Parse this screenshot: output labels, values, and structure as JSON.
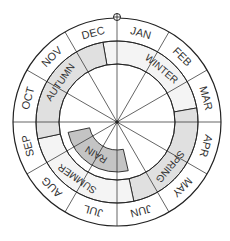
{
  "diagram": {
    "center": [
      117,
      122
    ],
    "radii": {
      "outer": 104,
      "month_inner": 81,
      "season_inner": 58,
      "rain_outer": 50,
      "rain_inner": 28
    },
    "months": [
      "JAN",
      "FEB",
      "MAR",
      "APR",
      "MAY",
      "JUN",
      "JUL",
      "AUG",
      "SEP",
      "OCT",
      "NOV",
      "DEC"
    ],
    "seasons": [
      {
        "label": "WINTER",
        "start": 350,
        "end": 80,
        "fill": "#f4f4f4",
        "label_angle": 40
      },
      {
        "label": "SPRING",
        "start": 80,
        "end": 168,
        "fill": "#e0e0e0",
        "label_angle": 130
      },
      {
        "label": "SUMMER",
        "start": 168,
        "end": 258,
        "fill": "#f4f4f4",
        "label_angle": 215
      },
      {
        "label": "AUTUMN",
        "start": 258,
        "end": 350,
        "fill": "#e0e0e0",
        "label_angle": 305
      }
    ],
    "rain": {
      "label": "RAIN",
      "start": 167,
      "end": 258,
      "fill": "#c4c4c4"
    },
    "top_marker": "circle-marker",
    "colors": {
      "line": "#222222",
      "text": "#333333"
    }
  }
}
